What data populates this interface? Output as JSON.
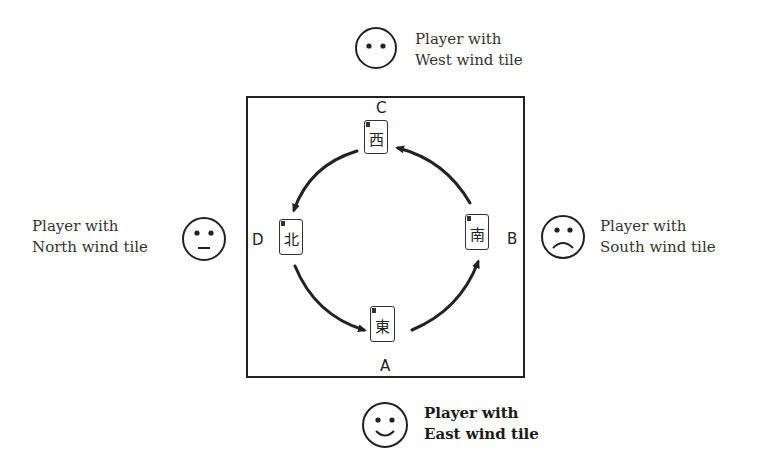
{
  "diagram": {
    "positions": {
      "A": "A",
      "B": "B",
      "C": "C",
      "D": "D"
    },
    "tiles": {
      "east": "東",
      "south": "南",
      "west": "西",
      "north": "北"
    },
    "players": {
      "west": {
        "line1": "Player with",
        "line2": "West wind tile",
        "face": "neutral-dots"
      },
      "north": {
        "line1": "Player with",
        "line2": "North wind tile",
        "face": "neutral"
      },
      "south": {
        "line1": "Player with",
        "line2": "South wind tile",
        "face": "sad"
      },
      "east": {
        "line1": "Player with",
        "line2": "East wind tile",
        "face": "happy",
        "emphasis": "bold"
      }
    },
    "flow": "counterclockwise: A (East) → B (South) → C (West) → D (North) → A",
    "colors": {
      "line": "#222222",
      "background": "#ffffff"
    }
  }
}
